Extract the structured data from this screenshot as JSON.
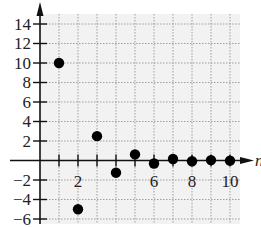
{
  "chart_data": {
    "type": "scatter",
    "title": "",
    "xlabel": "n",
    "ylabel": "",
    "xlim": [
      0,
      10.5
    ],
    "ylim": [
      -6.5,
      16
    ],
    "grid": true,
    "x_ticks": [
      2,
      4,
      6,
      8,
      10
    ],
    "x_tick_labels": [
      "2",
      "6",
      "8",
      "10"
    ],
    "y_ticks": [
      -6,
      -4,
      -2,
      2,
      4,
      6,
      8,
      10,
      12,
      14
    ],
    "y_tick_labels": [
      "−6",
      "−4",
      "−2",
      "2",
      "4",
      "6",
      "8",
      "10",
      "12",
      "14"
    ],
    "series": [
      {
        "name": "sequence",
        "x": [
          1,
          2,
          3,
          4,
          5,
          6,
          7,
          8,
          9,
          10
        ],
        "values": [
          10,
          -5,
          2.5,
          -1.25,
          0.625,
          -0.3125,
          0.156,
          -0.078,
          0.039,
          -0.02
        ]
      }
    ]
  },
  "colors": {
    "background": "#f2f2f2",
    "grid": "#8a8a8a",
    "axis": "#111111",
    "points": "#000000"
  }
}
